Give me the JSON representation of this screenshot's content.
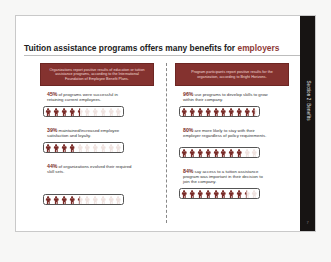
{
  "title": {
    "prefix": "Tuition assistance programs offers many benefits for ",
    "accent": "employers"
  },
  "sidebar": {
    "label": "Section 2: Benefits",
    "page_number": "7"
  },
  "colors": {
    "accent": "#84322f",
    "figure_filled": "#7a2b28",
    "figure_empty": "#efe2df",
    "sidebar": "#171413"
  },
  "left_column": {
    "banner": "Organizations report positive results of education or tuition assistance programs, according to the International Foundation of Employee Benefit Plans.",
    "stats": [
      {
        "percent": "45%",
        "text": " of programs were successful in retaining current employees.",
        "value": 45
      },
      {
        "percent": "39%",
        "text": " maintained/increased employee satisfaction and loyalty.",
        "value": 39
      },
      {
        "percent": "44%",
        "text": " of organizations evolved their required skill sets.",
        "value": 44
      }
    ]
  },
  "right_column": {
    "banner": "Program participants report positive results for the organization, according to Bright Horizons.",
    "stats": [
      {
        "percent": "96%",
        "text": " use programs to develop skills to grow within their company.",
        "value": 96
      },
      {
        "percent": "80%",
        "text": " are more likely to stay with their employer regardless of policy requirements.",
        "value": 80
      },
      {
        "percent": "84%",
        "text": " say access to a tuition assistance program was important in their decision to join the company.",
        "value": 84
      }
    ]
  },
  "icons": {
    "figure": "person-icon"
  }
}
